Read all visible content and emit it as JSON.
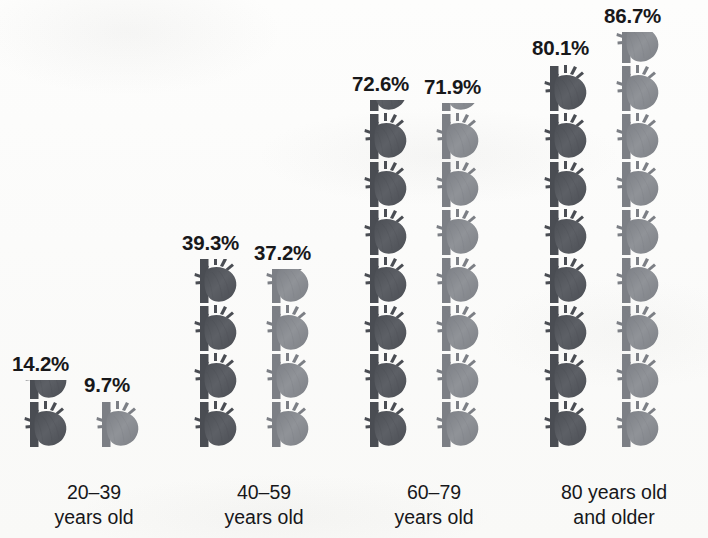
{
  "chart_data": {
    "type": "bar",
    "subtype": "pictogram",
    "title": "",
    "xlabel": "",
    "ylabel": "",
    "unit": "%",
    "icon": "anatomical-heart-icon",
    "icon_value": 10,
    "ylim": [
      0,
      100
    ],
    "grid": false,
    "legend": "none",
    "categories": [
      "20–39\nyears old",
      "40–59\nyears old",
      "60–79\nyears old",
      "80 years old\nand older"
    ],
    "series": [
      {
        "name": "series-1",
        "color": "#5d5f64",
        "values": [
          14.2,
          39.3,
          72.6,
          80.1
        ]
      },
      {
        "name": "series-2",
        "color": "#8e9196",
        "values": [
          9.7,
          37.2,
          71.9,
          86.7
        ]
      }
    ]
  },
  "groups": [
    {
      "id": "group-20-39",
      "label_line1": "20–39",
      "label_line2": "years old",
      "columns": [
        {
          "id": "col-20-39-a",
          "pct_label": "14.2%",
          "value": 14.2,
          "tone": "dark"
        },
        {
          "id": "col-20-39-b",
          "pct_label": "9.7%",
          "value": 9.7,
          "tone": "light"
        }
      ]
    },
    {
      "id": "group-40-59",
      "label_line1": "40–59",
      "label_line2": "years old",
      "columns": [
        {
          "id": "col-40-59-a",
          "pct_label": "39.3%",
          "value": 39.3,
          "tone": "dark"
        },
        {
          "id": "col-40-59-b",
          "pct_label": "37.2%",
          "value": 37.2,
          "tone": "light"
        }
      ]
    },
    {
      "id": "group-60-79",
      "label_line1": "60–79",
      "label_line2": "years old",
      "columns": [
        {
          "id": "col-60-79-a",
          "pct_label": "72.6%",
          "value": 72.6,
          "tone": "dark"
        },
        {
          "id": "col-60-79-b",
          "pct_label": "71.9%",
          "value": 71.9,
          "tone": "light"
        }
      ]
    },
    {
      "id": "group-80-plus",
      "label_line1": "80 years old",
      "label_line2": "and older",
      "columns": [
        {
          "id": "col-80-plus-a",
          "pct_label": "80.1%",
          "value": 80.1,
          "tone": "dark"
        },
        {
          "id": "col-80-plus-b",
          "pct_label": "86.7%",
          "value": 86.7,
          "tone": "light"
        }
      ]
    }
  ],
  "colors": {
    "dark_heart": "#5d6066",
    "dark_heart_shade": "#4a4d53",
    "light_heart": "#909398",
    "light_heart_shade": "#7c7f85",
    "text": "#17171a",
    "background": "#fcfcfb"
  },
  "layout": {
    "group_x": [
      0,
      170,
      340,
      520
    ],
    "group_width": 188,
    "column_offsets": [
      24,
      96
    ],
    "unit_height": 48,
    "baseline_from_bottom": 90
  }
}
